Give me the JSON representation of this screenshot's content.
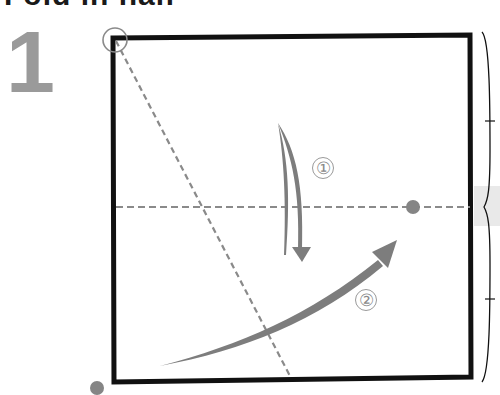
{
  "header": {
    "partial_title": "Fold in half"
  },
  "step": {
    "number": "1"
  },
  "diagram": {
    "type": "origami-fold-instruction",
    "paper": {
      "shape": "square",
      "border_color": "#111111"
    },
    "fold_lines": [
      {
        "name": "horizontal-center-fold",
        "style": "dashed",
        "color": "#888888"
      },
      {
        "name": "diagonal-fold",
        "style": "dashed",
        "color": "#888888"
      }
    ],
    "arrows": [
      {
        "name": "fold-arrow-1",
        "label": "1",
        "direction": "down",
        "color": "#808080"
      },
      {
        "name": "fold-arrow-2",
        "label": "2",
        "direction": "up-right",
        "color": "#808080"
      }
    ],
    "markers": [
      {
        "name": "corner-circle",
        "kind": "ring"
      },
      {
        "name": "reference-dot-right",
        "kind": "dot"
      },
      {
        "name": "reference-dot-bottom-left",
        "kind": "dot"
      }
    ],
    "brace": {
      "name": "equal-halves-brace",
      "ticks": 2,
      "band_color": "#e6e6e6"
    },
    "step_labels": [
      "①",
      "②"
    ]
  }
}
